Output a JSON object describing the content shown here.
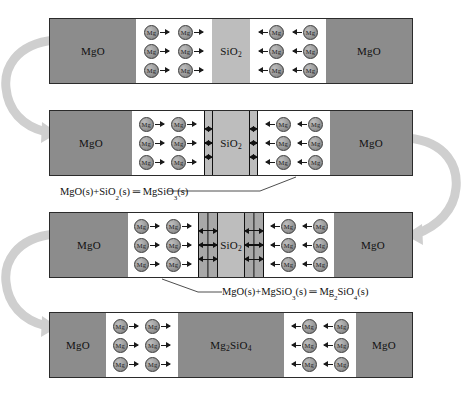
{
  "diagram": {
    "title_fragment": "",
    "stages": [
      {
        "id": "stage-1",
        "name": "initial-contact",
        "blocks": [
          {
            "kind": "mgo",
            "label": "MgO"
          },
          {
            "kind": "gap",
            "label": "",
            "ion": "Mg",
            "direction": "right",
            "rows": 3,
            "per_row": 2
          },
          {
            "kind": "sio2",
            "label": "SiO2",
            "formula": [
              "SiO",
              "2"
            ]
          },
          {
            "kind": "gap",
            "label": "",
            "ion": "Mg",
            "direction": "left",
            "rows": 3,
            "per_row": 2
          },
          {
            "kind": "mgo",
            "label": "MgO"
          }
        ]
      },
      {
        "id": "stage-2",
        "name": "mgsio3-layer-nucleation",
        "blocks": [
          {
            "kind": "mgo",
            "label": "MgO"
          },
          {
            "kind": "gap",
            "label": "",
            "ion": "Mg",
            "direction": "right",
            "rows": 3,
            "per_row": 2
          },
          {
            "kind": "layer",
            "label": "",
            "layers": 1
          },
          {
            "kind": "sio2",
            "label": "SiO2",
            "formula": [
              "SiO",
              "2"
            ]
          },
          {
            "kind": "layer",
            "label": "",
            "layers": 1
          },
          {
            "kind": "gap",
            "label": "",
            "ion": "Mg",
            "direction": "left",
            "rows": 3,
            "per_row": 2
          },
          {
            "kind": "mgo",
            "label": "MgO"
          }
        ]
      },
      {
        "id": "stage-3",
        "name": "mg2sio4-layer-growth",
        "blocks": [
          {
            "kind": "mgo",
            "label": "MgO"
          },
          {
            "kind": "gap",
            "label": "",
            "ion": "Mg",
            "direction": "right",
            "rows": 3,
            "per_row": 2
          },
          {
            "kind": "layer",
            "label": "",
            "layers": 2
          },
          {
            "kind": "sio2",
            "label": "SiO2",
            "formula": [
              "SiO",
              "2"
            ]
          },
          {
            "kind": "layer",
            "label": "",
            "layers": 2
          },
          {
            "kind": "gap",
            "label": "",
            "ion": "Mg",
            "direction": "left",
            "rows": 3,
            "per_row": 2
          },
          {
            "kind": "mgo",
            "label": "MgO"
          }
        ]
      },
      {
        "id": "stage-4",
        "name": "forsterite-complete",
        "blocks": [
          {
            "kind": "mgo",
            "label": "MgO"
          },
          {
            "kind": "gap",
            "label": "",
            "ion": "Mg",
            "direction": "right",
            "rows": 3,
            "per_row": 2
          },
          {
            "kind": "product",
            "label": "Mg2SiO4",
            "formula": [
              "Mg",
              "2",
              "SiO",
              "4"
            ]
          },
          {
            "kind": "gap",
            "label": "",
            "ion": "Mg",
            "direction": "left",
            "rows": 3,
            "per_row": 2
          },
          {
            "kind": "mgo",
            "label": "MgO"
          }
        ]
      }
    ],
    "equations": [
      {
        "id": "eq-1",
        "name": "reaction-mgsio3",
        "text": "MgO(s)+SiO₂(s) ═ MgSiO₃(s)",
        "parts": [
          "MgO(s)+SiO",
          "2",
          "(s) ═ MgSiO",
          "3",
          "(s)"
        ]
      },
      {
        "id": "eq-2",
        "name": "reaction-mg2sio4",
        "text": "MgO(s)+MgSiO₃(s) ═ Mg₂SiO₄(s)",
        "parts": [
          "MgO(s)+MgSiO",
          "3",
          "(s) ═ Mg",
          "2",
          "SiO",
          "4",
          "(s)"
        ]
      }
    ],
    "labels": {
      "mgo": "MgO",
      "sio2_base": "SiO",
      "sio2_sub": "2",
      "forsterite_a": "Mg",
      "forsterite_a_sub": "2",
      "forsterite_b": "SiO",
      "forsterite_b_sub": "4",
      "ion": "Mg"
    },
    "flow_arrows": [
      {
        "name": "flow-arrow-left-upper",
        "side": "left",
        "from_stage": 1,
        "to_stage": 2
      },
      {
        "name": "flow-arrow-right",
        "side": "right",
        "from_stage": 2,
        "to_stage": 3
      },
      {
        "name": "flow-arrow-left-lower",
        "side": "left",
        "from_stage": 3,
        "to_stage": 4
      }
    ],
    "colors": {
      "mgo": "#8c8c8c",
      "sio2": "#bdbdbd",
      "product": "#8c8c8c",
      "gap": "#ffffff",
      "outline": "#2b2b2b",
      "flow_arrow": "#cfcfcf",
      "text": "#111111"
    }
  }
}
